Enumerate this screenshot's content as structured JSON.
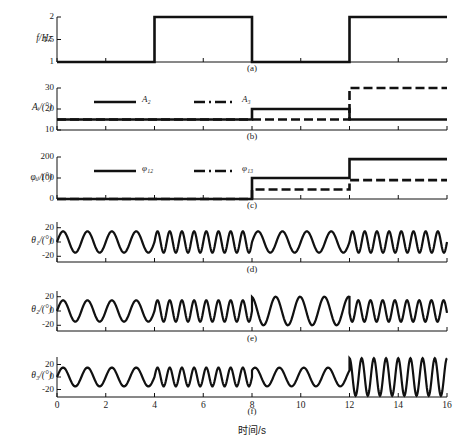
{
  "figure": {
    "xlabel": "时间/s",
    "panels": [
      {
        "id": "a",
        "caption": "(a)",
        "ylabel": "f/Hz",
        "yticks": [
          "1",
          "1.5",
          "2"
        ]
      },
      {
        "id": "b",
        "caption": "(b)",
        "ylabel": "Aᵢ/(°)",
        "yticks": [
          "10",
          "20",
          "30"
        ]
      },
      {
        "id": "c",
        "caption": "(c)",
        "ylabel": "φᵢⱼ/(°)",
        "yticks": [
          "0",
          "100",
          "200"
        ]
      },
      {
        "id": "d",
        "caption": "(d)",
        "ylabel": "θ₁/(°)",
        "yticks": [
          "-20",
          "0",
          "20"
        ]
      },
      {
        "id": "e",
        "caption": "(e)",
        "ylabel": "θ₂/(°)",
        "yticks": [
          "-20",
          "0",
          "20"
        ]
      },
      {
        "id": "f",
        "caption": "(f)",
        "ylabel": "θ₃/(°)",
        "yticks": [
          "-20",
          "0",
          "20"
        ]
      }
    ],
    "xticks": [
      "0",
      "2",
      "4",
      "6",
      "8",
      "10",
      "12",
      "14",
      "16"
    ],
    "legend_b": [
      {
        "label": "A₂",
        "style": "solid"
      },
      {
        "label": "A₃",
        "style": "dashdot"
      }
    ],
    "legend_c": [
      {
        "label": "φ₁₂",
        "style": "solid"
      },
      {
        "label": "φ₁₃",
        "style": "dashdot"
      }
    ]
  },
  "chart_data": [
    {
      "type": "line",
      "id": "a",
      "title": "(a)",
      "xlabel": "时间/s",
      "ylabel": "f/Hz",
      "xlim": [
        0,
        16
      ],
      "ylim": [
        1,
        2
      ],
      "xticks": [
        0,
        2,
        4,
        6,
        8,
        10,
        12,
        14,
        16
      ],
      "yticks": [
        1,
        1.5,
        2
      ],
      "grid": false,
      "series": [
        {
          "name": "f",
          "style": "solid",
          "step": true,
          "x": [
            0,
            4,
            4,
            8,
            8,
            12,
            12,
            16
          ],
          "y": [
            1,
            1,
            2,
            2,
            1,
            1,
            2,
            2
          ]
        }
      ]
    },
    {
      "type": "line",
      "id": "b",
      "title": "(b)",
      "xlabel": "时间/s",
      "ylabel": "Aᵢ/(°)",
      "xlim": [
        0,
        16
      ],
      "ylim": [
        10,
        30
      ],
      "xticks": [
        0,
        2,
        4,
        6,
        8,
        10,
        12,
        14,
        16
      ],
      "yticks": [
        10,
        20,
        30
      ],
      "grid": false,
      "series": [
        {
          "name": "A₂",
          "style": "solid",
          "step": true,
          "x": [
            0,
            8,
            8,
            12,
            12,
            16
          ],
          "y": [
            15,
            15,
            20,
            20,
            15,
            15
          ]
        },
        {
          "name": "A₃",
          "style": "dashdot",
          "step": true,
          "x": [
            0,
            12,
            12,
            16
          ],
          "y": [
            15,
            15,
            30,
            30
          ]
        }
      ]
    },
    {
      "type": "line",
      "id": "c",
      "title": "(c)",
      "xlabel": "时间/s",
      "ylabel": "φᵢⱼ/(°)",
      "xlim": [
        0,
        16
      ],
      "ylim": [
        0,
        200
      ],
      "xticks": [
        0,
        2,
        4,
        6,
        8,
        10,
        12,
        14,
        16
      ],
      "yticks": [
        0,
        100,
        200
      ],
      "grid": false,
      "series": [
        {
          "name": "φ₁₂",
          "style": "solid",
          "step": true,
          "x": [
            0,
            8,
            8,
            12,
            12,
            16
          ],
          "y": [
            0,
            0,
            100,
            100,
            190,
            190
          ]
        },
        {
          "name": "φ₁₃",
          "style": "dashdot",
          "step": true,
          "x": [
            0,
            8,
            8,
            12,
            12,
            16
          ],
          "y": [
            0,
            0,
            45,
            45,
            90,
            90
          ]
        }
      ]
    },
    {
      "type": "line",
      "id": "d",
      "title": "(d)",
      "xlabel": "时间/s",
      "ylabel": "θ₁/(°)",
      "xlim": [
        0,
        16
      ],
      "ylim": [
        -28,
        28
      ],
      "xticks": [
        0,
        2,
        4,
        6,
        8,
        10,
        12,
        14,
        16
      ],
      "yticks": [
        -20,
        0,
        20
      ],
      "grid": false,
      "series": [
        {
          "name": "θ₁",
          "style": "solid",
          "waveform": "sinusoid",
          "amplitude_segments": [
            {
              "t0": 0,
              "t1": 4,
              "freq": 1,
              "amp": 15,
              "phase_deg": 0
            },
            {
              "t0": 4,
              "t1": 8,
              "freq": 2,
              "amp": 15,
              "phase_deg": 0
            },
            {
              "t0": 8,
              "t1": 12,
              "freq": 1,
              "amp": 15,
              "phase_deg": 0
            },
            {
              "t0": 12,
              "t1": 16,
              "freq": 2,
              "amp": 15,
              "phase_deg": 0
            }
          ]
        }
      ]
    },
    {
      "type": "line",
      "id": "e",
      "title": "(e)",
      "xlabel": "时间/s",
      "ylabel": "θ₂/(°)",
      "xlim": [
        0,
        16
      ],
      "ylim": [
        -28,
        28
      ],
      "xticks": [
        0,
        2,
        4,
        6,
        8,
        10,
        12,
        14,
        16
      ],
      "yticks": [
        -20,
        0,
        20
      ],
      "grid": false,
      "series": [
        {
          "name": "θ₂",
          "style": "solid",
          "waveform": "sinusoid",
          "amplitude_segments": [
            {
              "t0": 0,
              "t1": 4,
              "freq": 1,
              "amp": 15,
              "phase_deg": 0
            },
            {
              "t0": 4,
              "t1": 8,
              "freq": 2,
              "amp": 15,
              "phase_deg": 0
            },
            {
              "t0": 8,
              "t1": 12,
              "freq": 1,
              "amp": 20,
              "phase_deg": 100
            },
            {
              "t0": 12,
              "t1": 16,
              "freq": 2,
              "amp": 15,
              "phase_deg": 190
            }
          ]
        }
      ]
    },
    {
      "type": "line",
      "id": "f",
      "title": "(f)",
      "xlabel": "时间/s",
      "ylabel": "θ₃/(°)",
      "xlim": [
        0,
        16
      ],
      "ylim": [
        -32,
        32
      ],
      "xticks": [
        0,
        2,
        4,
        6,
        8,
        10,
        12,
        14,
        16
      ],
      "yticks": [
        -20,
        0,
        20
      ],
      "grid": false,
      "series": [
        {
          "name": "θ₃",
          "style": "solid",
          "waveform": "sinusoid",
          "amplitude_segments": [
            {
              "t0": 0,
              "t1": 4,
              "freq": 1,
              "amp": 15,
              "phase_deg": 0
            },
            {
              "t0": 4,
              "t1": 8,
              "freq": 2,
              "amp": 15,
              "phase_deg": 0
            },
            {
              "t0": 8,
              "t1": 12,
              "freq": 1,
              "amp": 15,
              "phase_deg": 45
            },
            {
              "t0": 12,
              "t1": 16,
              "freq": 2,
              "amp": 30,
              "phase_deg": 90
            }
          ]
        }
      ]
    }
  ]
}
